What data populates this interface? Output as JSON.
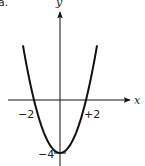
{
  "corner_mark": "a.",
  "chart_data": {
    "type": "line",
    "title": "",
    "function": "y = x^2 - 4",
    "xlabel": "x",
    "ylabel": "y",
    "x": [
      -2.8,
      -2.5,
      -2,
      -1.5,
      -1,
      -0.5,
      0,
      0.5,
      1,
      1.5,
      2,
      2.5,
      2.8
    ],
    "series": [
      {
        "name": "y = x^2 - 4",
        "values": [
          3.84,
          2.25,
          0,
          -1.75,
          -3,
          -3.75,
          -4,
          -3.75,
          -3,
          -1.75,
          0,
          2.25,
          3.84
        ]
      }
    ],
    "annotations": [
      {
        "label": "−2",
        "x": -2,
        "y": 0
      },
      {
        "label": "+2",
        "x": 2,
        "y": 0
      },
      {
        "label": "−4",
        "x": 0,
        "y": -4
      }
    ],
    "grid": false,
    "legend": false
  },
  "labels": {
    "x_axis": "x",
    "y_axis": "y",
    "root_left": "−2",
    "root_right": "+2",
    "vertex": "−4"
  }
}
